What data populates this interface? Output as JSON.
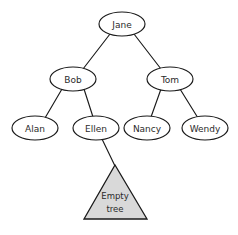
{
  "diagram": {
    "type": "binary-tree",
    "background_color": "#ffffff",
    "stroke_color": "#1a1a1a",
    "node_fill_color": "#ffffff",
    "text_color": "#2b2b2b",
    "subtree_fill_color": "#d9d9d9",
    "nodes": [
      {
        "id": "jane",
        "label": "Jane",
        "cx": 122,
        "cy": 24,
        "rx": 23,
        "ry": 12
      },
      {
        "id": "bob",
        "label": "Bob",
        "cx": 73,
        "cy": 79,
        "rx": 23,
        "ry": 12
      },
      {
        "id": "tom",
        "label": "Tom",
        "cx": 170,
        "cy": 79,
        "rx": 23,
        "ry": 12
      },
      {
        "id": "alan",
        "label": "Alan",
        "cx": 35,
        "cy": 128,
        "rx": 23,
        "ry": 12
      },
      {
        "id": "ellen",
        "label": "Ellen",
        "cx": 96,
        "cy": 128,
        "rx": 23,
        "ry": 12
      },
      {
        "id": "nancy",
        "label": "Nancy",
        "cx": 147,
        "cy": 128,
        "rx": 23,
        "ry": 12
      },
      {
        "id": "wendy",
        "label": "Wendy",
        "cx": 205,
        "cy": 128,
        "rx": 23,
        "ry": 12
      }
    ],
    "edges": [
      {
        "id": "jane-bob",
        "from": "jane",
        "to": "bob",
        "x1": 110,
        "y1": 34,
        "x2": 83,
        "y2": 69
      },
      {
        "id": "jane-tom",
        "from": "jane",
        "to": "tom",
        "x1": 134,
        "y1": 34,
        "x2": 161,
        "y2": 69
      },
      {
        "id": "bob-alan",
        "from": "bob",
        "to": "alan",
        "x1": 62,
        "y1": 89,
        "x2": 45,
        "y2": 118
      },
      {
        "id": "bob-ellen",
        "from": "bob",
        "to": "ellen",
        "x1": 84,
        "y1": 89,
        "x2": 93,
        "y2": 117
      },
      {
        "id": "tom-nancy",
        "from": "tom",
        "to": "nancy",
        "x1": 161,
        "y1": 89,
        "x2": 151,
        "y2": 117
      },
      {
        "id": "tom-wendy",
        "from": "tom",
        "to": "wendy",
        "x1": 180,
        "y1": 89,
        "x2": 198,
        "y2": 118
      },
      {
        "id": "ellen-subtree",
        "from": "ellen",
        "to": "subtree",
        "x1": 102,
        "y1": 139,
        "x2": 115,
        "y2": 166
      }
    ],
    "subtree": {
      "id": "empty-subtree",
      "label_line1": "Empty",
      "label_line2": "tree",
      "apex_x": 115,
      "apex_y": 165,
      "left_x": 84,
      "right_x": 147,
      "base_y": 219
    }
  }
}
